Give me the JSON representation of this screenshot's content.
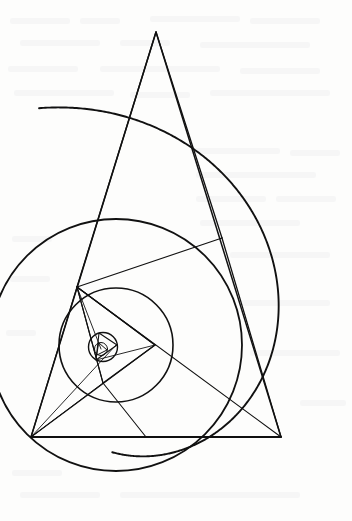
{
  "figure": {
    "background_color": "#fdfdfc",
    "stroke_color": "#111111",
    "canvas": {
      "width": 352,
      "height": 521
    }
  },
  "geometry": {
    "spiral": {
      "name": "equiangular-spiral-arc",
      "label": "Equiangular spiral arc",
      "center_x": 116.0,
      "center_y": 345.0,
      "start_radius": 249.0,
      "start_angle_deg": 108.0,
      "sweep_deg": 200.0,
      "growth_per_turn": 4.55,
      "stroke_width": 1.9
    },
    "levels": [
      {
        "name": "level-0-outer",
        "label": "Outermost level",
        "circle": {
          "name": "circumcircle-0",
          "cx": 116.0,
          "cy": 345.0,
          "r": 249.0,
          "visible": false,
          "stroke_width": 1.8
        },
        "triangle": {
          "name": "triangle-0",
          "visible": true,
          "stroke_width": 1.5,
          "vertices": [
            {
              "name": "vertex-0-apex",
              "x": 156.0,
              "y": 32.0
            },
            {
              "name": "vertex-0-left",
              "x": 31.0,
              "y": 437.0
            },
            {
              "name": "vertex-0-right",
              "x": 281.0,
              "y": 437.0
            }
          ]
        },
        "spokes": {
          "name": "spokes-0",
          "visible": false
        }
      },
      {
        "name": "level-1",
        "label": "First inner level",
        "circle": {
          "name": "circumcircle-1",
          "cx": 116.0,
          "cy": 345.0,
          "r": 126.0,
          "visible": true,
          "stroke_width": 1.8
        },
        "triangle": {
          "name": "triangle-1",
          "visible": true,
          "stroke_width": 1.3,
          "vertices": [
            {
              "name": "vertex-1-top",
              "x": 77.0,
              "y": 287.0
            },
            {
              "name": "vertex-1-left",
              "x": 31.0,
              "y": 437.0
            },
            {
              "name": "vertex-1-right",
              "x": 281.0,
              "y": 437.0
            }
          ]
        },
        "spokes": {
          "name": "spokes-1",
          "visible": true
        }
      },
      {
        "name": "level-2",
        "label": "Second inner level",
        "circle": {
          "name": "circumcircle-2",
          "cx": 116.0,
          "cy": 345.0,
          "r": 57.0,
          "visible": true,
          "stroke_width": 1.6
        },
        "triangle": {
          "name": "triangle-2",
          "visible": true,
          "stroke_width": 1.2,
          "vertices": [
            {
              "name": "vertex-2-top",
              "x": 77.0,
              "y": 287.0
            },
            {
              "name": "vertex-2-right",
              "x": 155.0,
              "y": 345.0
            },
            {
              "name": "vertex-2-bottom",
              "x": 103.0,
              "y": 383.0
            }
          ]
        },
        "spokes": {
          "name": "spokes-2",
          "visible": true
        }
      },
      {
        "name": "level-3",
        "label": "Third inner level",
        "circle": {
          "name": "circumcircle-3",
          "cx": 103.0,
          "cy": 347.0,
          "r": 14.5,
          "visible": true,
          "stroke_width": 1.4
        },
        "triangle": {
          "name": "triangle-3",
          "visible": true,
          "stroke_width": 1.1,
          "vertices": [
            {
              "name": "vertex-3-top",
              "x": 99.0,
              "y": 333.0
            },
            {
              "name": "vertex-3-right",
              "x": 117.0,
              "y": 345.0
            },
            {
              "name": "vertex-3-bottom",
              "x": 96.0,
              "y": 360.0
            }
          ]
        },
        "spokes": {
          "name": "spokes-3",
          "visible": true
        }
      },
      {
        "name": "level-4",
        "label": "Innermost level",
        "circle": {
          "name": "circumcircle-4",
          "cx": 101.0,
          "cy": 349.0,
          "r": 6.5,
          "visible": true,
          "stroke_width": 1.0
        },
        "triangle": {
          "name": "triangle-4",
          "visible": true,
          "stroke_width": 1.0,
          "vertices": [
            {
              "name": "vertex-4-top",
              "x": 99.0,
              "y": 343.0
            },
            {
              "name": "vertex-4-right",
              "x": 107.0,
              "y": 350.0
            },
            {
              "name": "vertex-4-bottom",
              "x": 97.0,
              "y": 355.0
            }
          ]
        },
        "spokes": {
          "name": "spokes-4",
          "visible": true
        }
      }
    ],
    "chords": [
      {
        "name": "chord-apex-to-midright",
        "x1": 156.0,
        "y1": 32.0,
        "x2": 222.0,
        "y2": 238.0,
        "stroke_width": 1.3
      },
      {
        "name": "chord-midright-to-right",
        "x1": 222.0,
        "y1": 238.0,
        "x2": 281.0,
        "y2": 437.0,
        "stroke_width": 1.3
      },
      {
        "name": "chord-midright-to-top",
        "x1": 222.0,
        "y1": 238.0,
        "x2": 77.0,
        "y2": 287.0,
        "stroke_width": 1.1
      },
      {
        "name": "chord-top-to-right",
        "x1": 77.0,
        "y1": 287.0,
        "x2": 281.0,
        "y2": 437.0,
        "stroke_width": 1.1
      },
      {
        "name": "chord-top-to-left",
        "x1": 77.0,
        "y1": 287.0,
        "x2": 31.0,
        "y2": 437.0,
        "stroke_width": 1.2
      },
      {
        "name": "baseline-left-to-right",
        "x1": 31.0,
        "y1": 437.0,
        "x2": 281.0,
        "y2": 437.0,
        "stroke_width": 2.1
      },
      {
        "name": "chord-left-to-midright",
        "x1": 31.0,
        "y1": 437.0,
        "x2": 155.0,
        "y2": 345.0,
        "stroke_width": 1.1
      },
      {
        "name": "chord-left-to-innerbot",
        "x1": 31.0,
        "y1": 437.0,
        "x2": 103.0,
        "y2": 383.0,
        "stroke_width": 1.0
      },
      {
        "name": "chord-left-to-innerctr",
        "x1": 31.0,
        "y1": 437.0,
        "x2": 116.0,
        "y2": 345.0,
        "stroke_width": 0.9
      },
      {
        "name": "chord-innerbot-down",
        "x1": 103.0,
        "y1": 383.0,
        "x2": 146.0,
        "y2": 437.0,
        "stroke_width": 1.1
      },
      {
        "name": "chord-top-to-innerright",
        "x1": 77.0,
        "y1": 287.0,
        "x2": 155.0,
        "y2": 345.0,
        "stroke_width": 1.1
      },
      {
        "name": "chord-top-to-innerbot",
        "x1": 77.0,
        "y1": 287.0,
        "x2": 103.0,
        "y2": 383.0,
        "stroke_width": 1.0
      },
      {
        "name": "chord-top-to-tiny",
        "x1": 77.0,
        "y1": 287.0,
        "x2": 101.0,
        "y2": 349.0,
        "stroke_width": 0.9
      },
      {
        "name": "chord-innerright-tiny",
        "x1": 155.0,
        "y1": 345.0,
        "x2": 96.0,
        "y2": 360.0,
        "stroke_width": 0.9
      },
      {
        "name": "chord-apex-to-top",
        "x1": 156.0,
        "y1": 32.0,
        "x2": 77.0,
        "y2": 287.0,
        "stroke_width": 1.4
      }
    ]
  },
  "chart_data": {
    "type": "diagram",
    "subtitle": "",
    "xlabel": "",
    "ylabel": "",
    "legend": [],
    "annotations": [],
    "grid": false,
    "series": [
      {
        "name": "circumradius-sequence",
        "description": "Radii of the successive circumscribed circles, in pixels",
        "categories": [
          "level 0",
          "level 1",
          "level 2",
          "level 3",
          "level 4"
        ],
        "values": [
          249.0,
          126.0,
          57.0,
          14.5,
          6.5
        ]
      },
      {
        "name": "scale-ratio-sequence",
        "description": "Ratio of each circumradius to the previous one",
        "categories": [
          "0 to 1",
          "1 to 2",
          "2 to 3",
          "3 to 4"
        ],
        "values": [
          0.506,
          0.452,
          0.254,
          0.448
        ]
      }
    ]
  }
}
